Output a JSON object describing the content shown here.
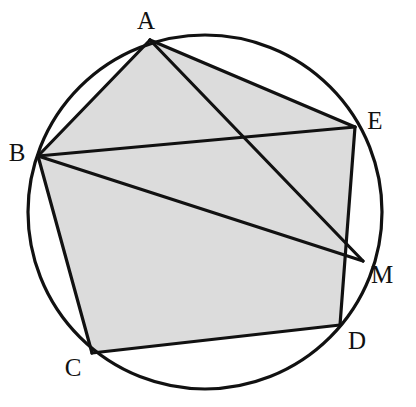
{
  "figure": {
    "background_color": "#ffffff",
    "stroke_color": "#111111",
    "fill_color": "#dcdcdc",
    "stroke_width": 3.2,
    "canvas": {
      "width": 416,
      "height": 407
    }
  },
  "chart_data": {
    "type": "diagram",
    "circle": {
      "cx": 205,
      "cy": 212,
      "r": 177
    },
    "points": [
      {
        "id": "A",
        "label": "A",
        "x": 150,
        "y": 40,
        "label_x": 146,
        "label_y": 20,
        "on_circle": true
      },
      {
        "id": "B",
        "label": "B",
        "x": 38,
        "y": 156,
        "label_x": 17,
        "label_y": 152,
        "on_circle": true
      },
      {
        "id": "C",
        "label": "C",
        "x": 92,
        "y": 353,
        "label_x": 73,
        "label_y": 367,
        "on_circle": true
      },
      {
        "id": "D",
        "label": "D",
        "x": 340,
        "y": 325,
        "label_x": 357,
        "label_y": 340,
        "on_circle": true
      },
      {
        "id": "E",
        "label": "E",
        "x": 355,
        "y": 127,
        "label_x": 375,
        "label_y": 120,
        "on_circle": true
      },
      {
        "id": "M",
        "label": "M",
        "x": 363,
        "y": 261,
        "label_x": 382,
        "label_y": 274,
        "on_circle": true
      }
    ],
    "shaded_region": {
      "name": "pentagon-ABCDE",
      "vertices": [
        "A",
        "B",
        "C",
        "D",
        "E"
      ],
      "fill": "#dcdcdc"
    },
    "segments": [
      {
        "name": "AB",
        "from": "A",
        "to": "B"
      },
      {
        "name": "BC",
        "from": "B",
        "to": "C"
      },
      {
        "name": "CD",
        "from": "C",
        "to": "D"
      },
      {
        "name": "DE",
        "from": "D",
        "to": "E"
      },
      {
        "name": "EA",
        "from": "E",
        "to": "A"
      },
      {
        "name": "BE",
        "from": "B",
        "to": "E"
      },
      {
        "name": "AM",
        "from": "A",
        "to": "M"
      },
      {
        "name": "BM",
        "from": "B",
        "to": "M"
      }
    ],
    "labels": [
      "A",
      "B",
      "C",
      "D",
      "E",
      "M"
    ]
  }
}
